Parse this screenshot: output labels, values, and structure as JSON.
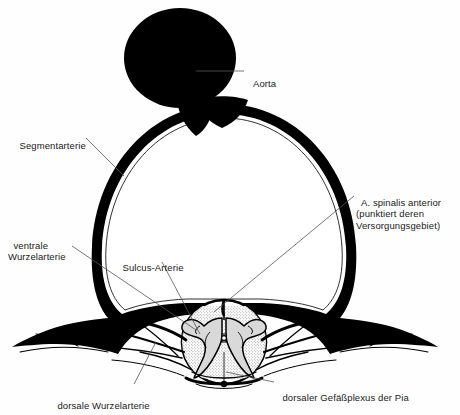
{
  "figure": {
    "background_color": "#fefefe",
    "ink_color": "#000000",
    "gray_matter_fill": "#d8d8d8",
    "leader_line_color": "#555555"
  },
  "labels": [
    {
      "id": "aorta",
      "name": "Aorta",
      "text": "Aorta",
      "x": 248,
      "y": 66,
      "align": "left",
      "lines": 1
    },
    {
      "id": "segmentarterie",
      "name": "Segmentarterie",
      "text": "Segmentarterie",
      "x": 14,
      "y": 128,
      "align": "left",
      "lines": 1
    },
    {
      "id": "a-spinalis-anterior",
      "name": "A. spinalis anterior",
      "text": "A. spinalis anterior\n(punktiert deren\nVersorgungsgebiet)",
      "x": 356,
      "y": 185,
      "align": "left",
      "lines": 3
    },
    {
      "id": "ventrale-wurzelarterie",
      "name": "ventrale Wurzelarterie",
      "text": "ventrale\nWurzelarterie",
      "x": 8,
      "y": 228,
      "align": "left",
      "lines": 2
    },
    {
      "id": "sulcus-arterie",
      "name": "Sulcus-Arterie",
      "text": "Sulcus-Arterie",
      "x": 117,
      "y": 250,
      "align": "left",
      "lines": 1
    },
    {
      "id": "dorsale-wurzelarterie",
      "name": "dorsale Wurzelarterie",
      "text": "dorsale Wurzelarterie",
      "x": 52,
      "y": 388,
      "align": "left",
      "lines": 1
    },
    {
      "id": "dorsaler-gefaessplexus",
      "name": "dorsaler Gefaessplexus der Pia",
      "text": "dorsaler Gefäßplexus der Pia",
      "x": 277,
      "y": 380,
      "align": "left",
      "lines": 1
    }
  ],
  "structures": [
    {
      "id": "aorta-body",
      "name": "aorta-vessel",
      "description": "grosses schwarz ausgefuelltes Gefaesslumen oben mittig"
    },
    {
      "id": "segmental-ring",
      "name": "segmental-artery-ring",
      "description": "dicker schwarzer Arterienring um das Wirbelloch"
    },
    {
      "id": "spinal-cord",
      "name": "spinal-cord-cross-section",
      "description": "runder Rueckenmarksquerschnitt"
    },
    {
      "id": "gray-matter",
      "name": "gray-matter-butterfly",
      "description": "schmetterlingsfoermige graue Substanz, punktiert"
    },
    {
      "id": "central-canal",
      "name": "central-canal",
      "description": "Zentralkanal"
    },
    {
      "id": "pia-plexus",
      "name": "dorsal-pial-plexus",
      "description": "dorsaler Gefaessplexus der Pia mater"
    },
    {
      "id": "root-arteries",
      "name": "radicular-arteries",
      "description": "ventrale und dorsale Wurzelarterien"
    }
  ]
}
